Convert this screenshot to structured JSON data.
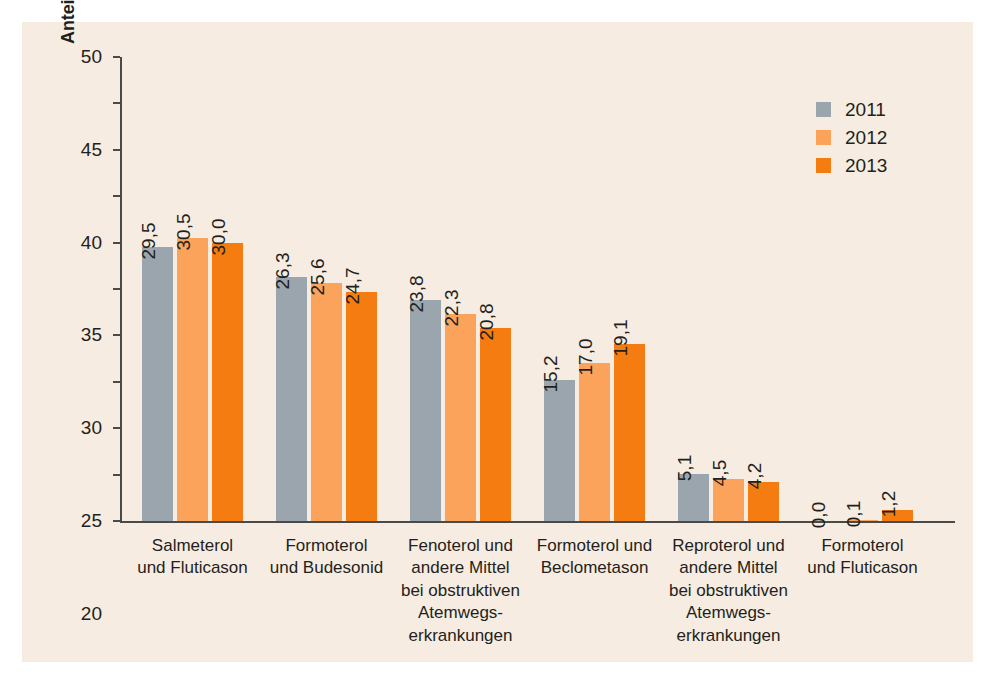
{
  "chart_data": {
    "type": "bar",
    "title": "",
    "xlabel": "",
    "ylabel": "Anteil an verordneten DDD (%)",
    "ylim": [
      0,
      50
    ],
    "yticks": [
      0,
      5,
      10,
      15,
      20,
      25,
      30,
      35,
      40,
      45,
      50
    ],
    "ytick_labels": [
      "0",
      "5",
      "10",
      "15",
      "20",
      "25",
      "30",
      "35",
      "40",
      "45",
      "50"
    ],
    "grid": false,
    "legend_position": "top-right",
    "value_label_format": "comma-decimal",
    "categories": [
      "Salmeterol\nund Fluticason",
      "Formoterol\nund Budesonid",
      "Fenoterol und\nandere Mittel\nbei obstruktiven\nAtemwegs-\nerkrankungen",
      "Formoterol und\nBeclometason",
      "Reproterol und\nandere Mittel\nbei obstruktiven\nAtemwegs-\nerkrankungen",
      "Formoterol\nund Fluticason"
    ],
    "series": [
      {
        "name": "2011",
        "color": "#9aa5ae",
        "values": [
          29.5,
          26.3,
          23.8,
          15.2,
          5.1,
          0.0
        ],
        "labels": [
          "29,5",
          "26,3",
          "23,8",
          "15,2",
          "5,1",
          "0,0"
        ]
      },
      {
        "name": "2012",
        "color": "#fba35a",
        "values": [
          30.5,
          25.6,
          22.3,
          17.0,
          4.5,
          0.1
        ],
        "labels": [
          "30,5",
          "25,6",
          "22,3",
          "17,0",
          "4,5",
          "0,1"
        ]
      },
      {
        "name": "2013",
        "color": "#f57c10",
        "values": [
          30.0,
          24.7,
          20.8,
          19.1,
          4.2,
          1.2
        ],
        "labels": [
          "30,0",
          "24,7",
          "20,8",
          "19,1",
          "4,2",
          "1,2"
        ]
      }
    ]
  },
  "legend": {
    "entries": [
      {
        "label": "2011",
        "color": "#9aa5ae"
      },
      {
        "label": "2012",
        "color": "#fba35a"
      },
      {
        "label": "2013",
        "color": "#f57c10"
      }
    ]
  },
  "panel": {
    "background_color": "#f7ece1",
    "axis_color": "#4a4a48",
    "text_color": "#231f20"
  }
}
